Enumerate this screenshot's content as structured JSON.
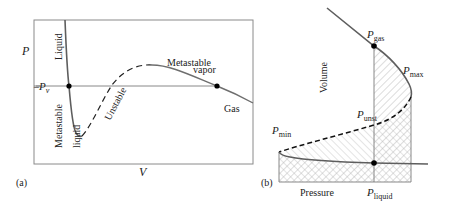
{
  "panel_a": {
    "label": "(a)",
    "y_axis_label": "P",
    "x_axis_label": "V",
    "pv_label": "P",
    "pv_subscript": "v",
    "regions": {
      "liquid": "Liquid",
      "metastable_liquid_line1": "Metastable",
      "metastable_liquid_line2": "liquid",
      "unstable": "Unstable",
      "metastable_vapor_line1": "Metastable",
      "metastable_vapor_line2": "vapor",
      "gas": "Gas"
    }
  },
  "panel_b": {
    "label": "(b)",
    "y_axis_label": "Volume",
    "x_axis_label": "Pressure",
    "points": {
      "p_gas": {
        "main": "P",
        "sub": "gas"
      },
      "p_max": {
        "main": "P",
        "sub": "max"
      },
      "p_unst": {
        "main": "P",
        "sub": "unst"
      },
      "p_min": {
        "main": "P",
        "sub": "min"
      },
      "p_liquid": {
        "main": "P",
        "sub": "liquid"
      }
    }
  },
  "colors": {
    "curve": "#6a6a6a",
    "frame": "#8a8a8a",
    "dashed": "#111111",
    "hatch": "#9a9a9a",
    "point": "#000000"
  }
}
